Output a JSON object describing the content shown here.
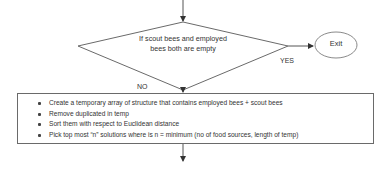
{
  "diagram": {
    "type": "flowchart-fragment",
    "decision": {
      "text": "If scout bees and employed bees both are empty",
      "line1": "If scout bees and employed",
      "line2": "bees both are empty"
    },
    "branches": {
      "yes_label": "YES",
      "no_label": "NO"
    },
    "terminal": {
      "label": "Exit"
    },
    "process": {
      "steps": [
        "Create a temporary array of structure  that contains employed bees + scout bees",
        "Remove duplicated in temp",
        "Sort them with respect to Euclidean distance",
        "Pick top most “n” solutions  where is n = minimum (no of food sources, length of temp)"
      ]
    },
    "colors": {
      "stroke": "#6a6a6a",
      "arrow": "#333333",
      "text": "#333333",
      "background": "#ffffff"
    }
  }
}
